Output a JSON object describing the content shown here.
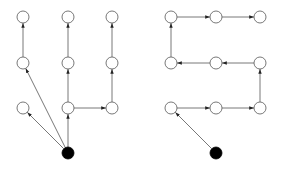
{
  "diagram": {
    "title": "",
    "colors": {
      "background": "#ffffff",
      "node_fill": "#ffffff",
      "node_stroke": "#555555",
      "root_fill": "#000000",
      "edge": "#555555"
    },
    "node_radius": 6,
    "graphs": [
      {
        "id": "left-tree",
        "description": "Tree: root branches to several vertical chains",
        "nodes": [
          {
            "id": "L0",
            "x": 68,
            "y": 153,
            "root": true
          },
          {
            "id": "L1",
            "x": 23,
            "y": 108
          },
          {
            "id": "L2",
            "x": 23,
            "y": 63
          },
          {
            "id": "L3",
            "x": 23,
            "y": 17
          },
          {
            "id": "L4",
            "x": 68,
            "y": 108
          },
          {
            "id": "L5",
            "x": 68,
            "y": 63
          },
          {
            "id": "L6",
            "x": 68,
            "y": 17
          },
          {
            "id": "L7",
            "x": 112,
            "y": 108
          },
          {
            "id": "L8",
            "x": 112,
            "y": 63
          },
          {
            "id": "L9",
            "x": 112,
            "y": 17
          }
        ],
        "edges": [
          {
            "from": "L0",
            "to": "L1"
          },
          {
            "from": "L0",
            "to": "L2"
          },
          {
            "from": "L2",
            "to": "L3"
          },
          {
            "from": "L0",
            "to": "L4"
          },
          {
            "from": "L4",
            "to": "L5"
          },
          {
            "from": "L5",
            "to": "L6"
          },
          {
            "from": "L4",
            "to": "L7"
          },
          {
            "from": "L7",
            "to": "L8"
          },
          {
            "from": "L8",
            "to": "L9"
          }
        ]
      },
      {
        "id": "right-path",
        "description": "Snake-shaped path from root",
        "nodes": [
          {
            "id": "R0",
            "x": 216,
            "y": 153,
            "root": true
          },
          {
            "id": "R1",
            "x": 171,
            "y": 108
          },
          {
            "id": "R2",
            "x": 216,
            "y": 108
          },
          {
            "id": "R3",
            "x": 260,
            "y": 108
          },
          {
            "id": "R4",
            "x": 260,
            "y": 63
          },
          {
            "id": "R5",
            "x": 216,
            "y": 63
          },
          {
            "id": "R6",
            "x": 171,
            "y": 63
          },
          {
            "id": "R7",
            "x": 171,
            "y": 17
          },
          {
            "id": "R8",
            "x": 216,
            "y": 17
          },
          {
            "id": "R9",
            "x": 260,
            "y": 17
          }
        ],
        "edges": [
          {
            "from": "R0",
            "to": "R1"
          },
          {
            "from": "R1",
            "to": "R2"
          },
          {
            "from": "R2",
            "to": "R3"
          },
          {
            "from": "R3",
            "to": "R4"
          },
          {
            "from": "R4",
            "to": "R5"
          },
          {
            "from": "R5",
            "to": "R6"
          },
          {
            "from": "R6",
            "to": "R7"
          },
          {
            "from": "R7",
            "to": "R8"
          },
          {
            "from": "R8",
            "to": "R9"
          }
        ]
      }
    ]
  }
}
